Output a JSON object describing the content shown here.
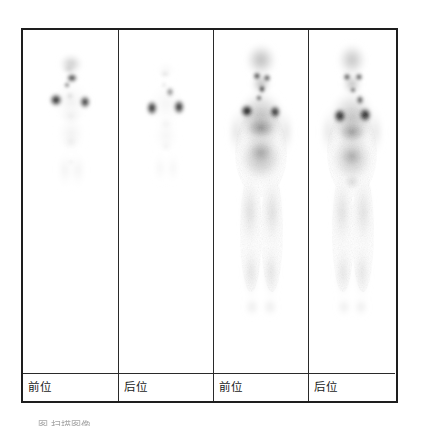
{
  "figure": {
    "modality": "whole-body-scintigraphy",
    "panel_count": 4,
    "frame_color": "#1e1e1e",
    "background_color": "#ffffff",
    "caption_partial": "图  扫描图像"
  },
  "panels": [
    {
      "id": "panel-1",
      "label": "前位",
      "view": "anterior",
      "scan_type": "localized-uptake",
      "body_extent": "upper-torso",
      "uptake_intensity": "focal-high",
      "hotspots": [
        "thyroid",
        "left-axilla",
        "right-axilla",
        "mediastinum"
      ]
    },
    {
      "id": "panel-2",
      "label": "后位",
      "view": "posterior",
      "scan_type": "localized-uptake",
      "body_extent": "upper-torso",
      "uptake_intensity": "focal-high",
      "hotspots": [
        "left-axilla",
        "right-axilla",
        "neck"
      ]
    },
    {
      "id": "panel-3",
      "label": "前位",
      "view": "anterior",
      "scan_type": "whole-body",
      "body_extent": "head-to-feet",
      "uptake_intensity": "diffuse-with-focal",
      "hotspots": [
        "thyroid",
        "left-axilla",
        "right-axilla",
        "liver",
        "mediastinum"
      ]
    },
    {
      "id": "panel-4",
      "label": "后位",
      "view": "posterior",
      "scan_type": "whole-body",
      "body_extent": "head-to-feet",
      "uptake_intensity": "diffuse-with-focal",
      "hotspots": [
        "left-axilla",
        "right-axilla",
        "spine",
        "kidneys"
      ]
    }
  ]
}
